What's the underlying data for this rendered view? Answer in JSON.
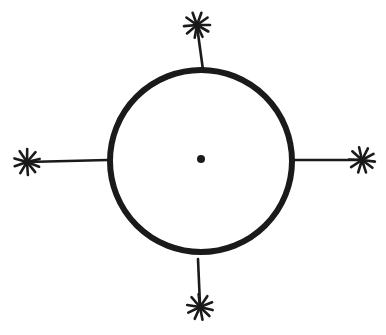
{
  "diagram": {
    "stroke_color": "#1a1a1a",
    "background": "#ffffff",
    "circle": {
      "cx": 201,
      "cy": 161,
      "r": 91
    },
    "center_dot": {
      "cx": 201,
      "cy": 159,
      "r": 4
    },
    "rays": [
      {
        "direction": "up",
        "x1": 203,
        "y1": 70,
        "x2": 197,
        "y2": 26
      },
      {
        "direction": "right",
        "x1": 293,
        "y1": 160,
        "x2": 362,
        "y2": 160
      },
      {
        "direction": "down",
        "x1": 198,
        "y1": 259,
        "x2": 200,
        "y2": 305
      },
      {
        "direction": "left",
        "x1": 108,
        "y1": 160,
        "x2": 27,
        "y2": 162
      }
    ],
    "stars": [
      {
        "name": "star-top",
        "cx": 197,
        "cy": 25
      },
      {
        "name": "star-right",
        "cx": 362,
        "cy": 160
      },
      {
        "name": "star-bottom",
        "cx": 200,
        "cy": 307
      },
      {
        "name": "star-left",
        "cx": 27,
        "cy": 162
      }
    ]
  }
}
